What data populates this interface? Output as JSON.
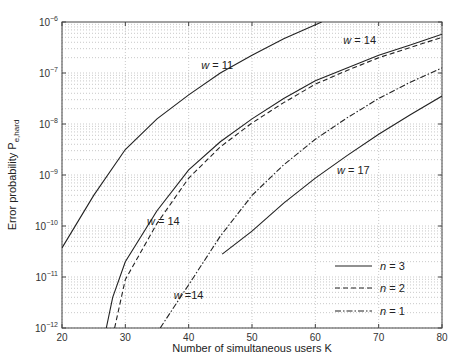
{
  "chart_data": {
    "type": "line",
    "title": "",
    "xlabel": "Number of simultaneous users  K",
    "ylabel": "Error probability  P_e,hard",
    "xlim": [
      20,
      80
    ],
    "ylim": [
      1e-12,
      1e-06
    ],
    "yscale": "log",
    "grid": true,
    "x_ticks": [
      "20",
      "30",
      "40",
      "50",
      "60",
      "70",
      "80"
    ],
    "y_ticks": [
      "10^-12",
      "10^-11",
      "10^-10",
      "10^-9",
      "10^-8",
      "10^-7",
      "10^-6"
    ],
    "legend": {
      "position": "lower right",
      "entries": [
        {
          "label": "n = 3",
          "style": "solid"
        },
        {
          "label": "n = 2",
          "style": "dashed"
        },
        {
          "label": "n = 1",
          "style": "dashdot"
        }
      ]
    },
    "series": [
      {
        "name": "w = 11, n = 3",
        "style": "solid",
        "x": [
          20,
          25,
          30,
          35,
          40,
          45,
          50,
          55,
          61
        ],
        "log10_y": [
          -10.43,
          -9.4,
          -8.5,
          -7.9,
          -7.43,
          -7.0,
          -6.65,
          -6.33,
          -6.0
        ]
      },
      {
        "name": "w = 14, n = 3",
        "style": "solid",
        "x": [
          27,
          28,
          30,
          35,
          40,
          45,
          50,
          55,
          60,
          65,
          70,
          75,
          80
        ],
        "log10_y": [
          -12.0,
          -11.4,
          -10.7,
          -9.7,
          -8.9,
          -8.35,
          -7.9,
          -7.5,
          -7.15,
          -6.9,
          -6.65,
          -6.45,
          -6.24
        ]
      },
      {
        "name": "w = 14, n = 2",
        "style": "dashed",
        "x": [
          28.3,
          30,
          35,
          40,
          45,
          50,
          55,
          60,
          65,
          70,
          75,
          80
        ],
        "log10_y": [
          -12.0,
          -11.05,
          -9.95,
          -9.06,
          -8.45,
          -7.98,
          -7.58,
          -7.22,
          -6.95,
          -6.7,
          -6.5,
          -6.3
        ]
      },
      {
        "name": "w = 14, n = 1",
        "style": "dashdot",
        "x": [
          35.5,
          40,
          45,
          50,
          55,
          60,
          65,
          70,
          75,
          80
        ],
        "log10_y": [
          -12.0,
          -11.15,
          -10.2,
          -9.4,
          -8.8,
          -8.3,
          -7.88,
          -7.5,
          -7.18,
          -6.9
        ]
      },
      {
        "name": "w = 17, n = 3",
        "style": "solid",
        "x": [
          45.3,
          50,
          55,
          60,
          65,
          70,
          75,
          80
        ],
        "log10_y": [
          -10.55,
          -10.1,
          -9.55,
          -9.06,
          -8.62,
          -8.2,
          -7.82,
          -7.45
        ]
      }
    ],
    "annotations": [
      {
        "text": "w = 11",
        "x": 44.5,
        "log10_y": -6.85
      },
      {
        "text": "w = 14",
        "x": 67,
        "log10_y": -6.35
      },
      {
        "text": "w = 17",
        "x": 66,
        "log10_y": -8.9
      },
      {
        "text": "w = 14",
        "x": 36,
        "log10_y": -9.9
      },
      {
        "text": "w =14",
        "x": 40,
        "log10_y": -11.35
      }
    ]
  }
}
